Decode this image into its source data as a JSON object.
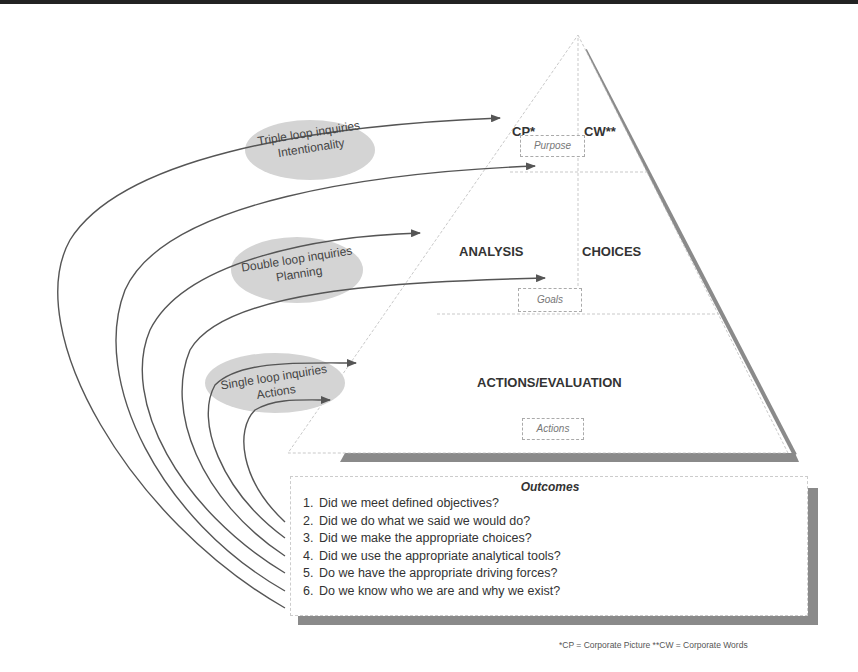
{
  "diagram": {
    "pyramid": {
      "top_left_label": "CP*",
      "top_right_label": "CW**",
      "top_box": "Purpose",
      "middle_left_label": "ANALYSIS",
      "middle_right_label": "CHOICES",
      "middle_box": "Goals",
      "bottom_label": "ACTIONS/EVALUATION",
      "bottom_box": "Actions"
    },
    "loops": [
      {
        "line1": "Triple loop inquiries",
        "line2": "Intentionality"
      },
      {
        "line1": "Double loop inquiries",
        "line2": "Planning"
      },
      {
        "line1": "Single loop inquiries",
        "line2": "Actions"
      }
    ],
    "outcomes": {
      "title": "Outcomes",
      "items": [
        {
          "num": "1.",
          "text": "Did we meet defined objectives?"
        },
        {
          "num": "2.",
          "text": "Did we do what we said we would do?"
        },
        {
          "num": "3.",
          "text": "Did we make the appropriate choices?"
        },
        {
          "num": "4.",
          "text": "Did we use the appropriate analytical tools?"
        },
        {
          "num": "5.",
          "text": "Do we have the appropriate driving forces?"
        },
        {
          "num": "6.",
          "text": "Do we know who we are and why we exist?"
        }
      ]
    },
    "footnote": "*CP = Corporate Picture  **CW = Corporate Words",
    "colors": {
      "line": "#555555",
      "shadow": "#8a8a8a",
      "ellipse": "#d4d4d4",
      "text": "#333333"
    }
  }
}
